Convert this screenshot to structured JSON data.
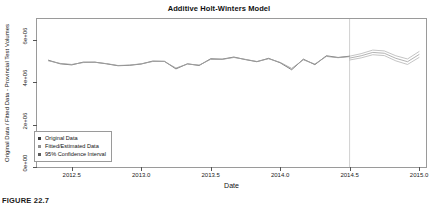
{
  "figure": {
    "caption": "FIGURE 22.7"
  },
  "chart_data": {
    "type": "line",
    "title": "Additive Holt-Winters Model",
    "xlabel": "Date",
    "ylabel": "Original Data / Fitted Data - Provincial Test Volumes",
    "xlim": [
      2012.25,
      2015.05
    ],
    "ylim": [
      0,
      7000000
    ],
    "grid": false,
    "legend_position": "bottom-left",
    "xticks": [
      "2012.5",
      "2013.0",
      "2013.5",
      "2014.0",
      "2014.5",
      "2015.0"
    ],
    "xtick_values": [
      2012.5,
      2013.0,
      2013.5,
      2014.0,
      2014.5,
      2015.0
    ],
    "yticks": [
      "0e+00",
      "2e+06",
      "4e+06",
      "6e+06"
    ],
    "ytick_values": [
      0,
      2000000,
      4000000,
      6000000
    ],
    "forecast_start": 2014.5,
    "annotations": [
      {
        "name": "forecast-divider",
        "type": "vline",
        "x": 2014.5
      }
    ],
    "legend": [
      {
        "label": "Original Data",
        "marker": "square",
        "color": "#3b3b3b"
      },
      {
        "label": "Fitted/Estimated Data",
        "marker": "square",
        "color": "#8f8f8f"
      },
      {
        "label": "95% Confidence Interval",
        "marker": "square",
        "color": "#5c5c5c"
      }
    ],
    "series": [
      {
        "name": "Original Data",
        "color": "#6d6d6d",
        "x": [
          2012.333,
          2012.417,
          2012.5,
          2012.583,
          2012.667,
          2012.75,
          2012.833,
          2012.917,
          2013.0,
          2013.083,
          2013.167,
          2013.25,
          2013.333,
          2013.417,
          2013.5,
          2013.583,
          2013.667,
          2013.75,
          2013.833,
          2013.917,
          2014.0,
          2014.083,
          2014.167,
          2014.25,
          2014.333,
          2014.417,
          2014.5
        ],
        "values": [
          5050000,
          4880000,
          4830000,
          4960000,
          4960000,
          4880000,
          4790000,
          4810000,
          4870000,
          5010000,
          5000000,
          4640000,
          4880000,
          4800000,
          5120000,
          5100000,
          5200000,
          5080000,
          4980000,
          5140000,
          4930000,
          4600000,
          5100000,
          4840000,
          5260000,
          5180000,
          5240000
        ]
      },
      {
        "name": "Fitted/Estimated Data",
        "color": "#a0a0a0",
        "x": [
          2012.333,
          2012.417,
          2012.5,
          2012.583,
          2012.667,
          2012.75,
          2012.833,
          2012.917,
          2013.0,
          2013.083,
          2013.167,
          2013.25,
          2013.333,
          2013.417,
          2013.5,
          2013.583,
          2013.667,
          2013.75,
          2013.833,
          2013.917,
          2014.0,
          2014.083,
          2014.167,
          2014.25,
          2014.333,
          2014.417,
          2014.5
        ],
        "values": [
          5020000,
          4900000,
          4850000,
          4940000,
          4950000,
          4890000,
          4800000,
          4820000,
          4880000,
          4990000,
          4990000,
          4680000,
          4870000,
          4820000,
          5090000,
          5090000,
          5180000,
          5090000,
          4990000,
          5120000,
          4950000,
          4660000,
          5070000,
          4870000,
          5230000,
          5170000,
          5220000
        ]
      },
      {
        "name": "Forecast",
        "color": "#a0a0a0",
        "forecast": true,
        "x": [
          2014.5,
          2014.583,
          2014.667,
          2014.75,
          2014.833,
          2014.917,
          2015.0
        ],
        "values": [
          5150000,
          5260000,
          5420000,
          5380000,
          5140000,
          4980000,
          5320000
        ]
      },
      {
        "name": "95% Confidence Interval Upper",
        "color": "#b5b5b5",
        "forecast": true,
        "x": [
          2014.5,
          2014.583,
          2014.667,
          2014.75,
          2014.833,
          2014.917,
          2015.0
        ],
        "values": [
          5240000,
          5360000,
          5530000,
          5490000,
          5260000,
          5110000,
          5460000
        ]
      },
      {
        "name": "95% Confidence Interval Lower",
        "color": "#b5b5b5",
        "forecast": true,
        "x": [
          2014.5,
          2014.583,
          2014.667,
          2014.75,
          2014.833,
          2014.917,
          2015.0
        ],
        "values": [
          5060000,
          5160000,
          5310000,
          5270000,
          5020000,
          4850000,
          5180000
        ]
      }
    ]
  }
}
